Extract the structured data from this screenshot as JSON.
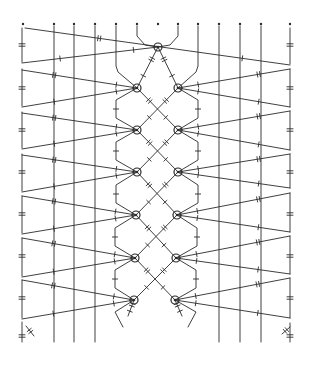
{
  "diagram": {
    "type": "bobbin-lace-pricking",
    "colors": {
      "ink": "#2a2a2a",
      "paper": "#ffffff"
    },
    "pins_top": {
      "y": 24,
      "x": [
        23,
        54,
        74,
        95,
        116,
        137,
        158,
        178,
        198,
        219,
        240,
        261,
        290
      ]
    },
    "straight_threads": {
      "x": [
        54,
        74,
        95,
        219,
        240,
        261
      ],
      "y1": 26,
      "y2": 342
    },
    "edges": {
      "left": {
        "x": 22,
        "y1": 28,
        "y2": 342,
        "gaps": [
          62,
          69,
          106,
          112,
          148,
          154,
          191,
          196,
          233,
          238,
          276,
          280,
          318,
          322
        ]
      },
      "right": {
        "x": 290,
        "y1": 28,
        "y2": 342,
        "gaps": [
          64,
          69,
          107,
          111,
          150,
          154,
          188,
          193,
          232,
          236,
          274,
          278,
          318,
          323
        ]
      },
      "edge_ticks_left_y": [
        45,
        88,
        130,
        172,
        214,
        256,
        298,
        336
      ],
      "edge_ticks_right_y": [
        45,
        88,
        130,
        172,
        214,
        256,
        298,
        336
      ]
    },
    "rings": [
      {
        "cx": 158,
        "cy": 47
      },
      {
        "cx": 137,
        "cy": 88
      },
      {
        "cx": 178,
        "cy": 88
      },
      {
        "cx": 137,
        "cy": 130
      },
      {
        "cx": 178,
        "cy": 130
      },
      {
        "cx": 137,
        "cy": 172
      },
      {
        "cx": 178,
        "cy": 172
      },
      {
        "cx": 136,
        "cy": 215
      },
      {
        "cx": 177,
        "cy": 215
      },
      {
        "cx": 135,
        "cy": 258
      },
      {
        "cx": 176,
        "cy": 258
      },
      {
        "cx": 134,
        "cy": 300
      },
      {
        "cx": 175,
        "cy": 300
      }
    ],
    "rails": [
      {
        "name": "left-rail",
        "points": [
          [
            116,
            26
          ],
          [
            116,
            66
          ],
          [
            118,
            72
          ],
          [
            137,
            88
          ],
          [
            116,
            100
          ],
          [
            116,
            118
          ],
          [
            137,
            130
          ],
          [
            116,
            142
          ],
          [
            116,
            160
          ],
          [
            137,
            172
          ],
          [
            116,
            185
          ],
          [
            116,
            203
          ],
          [
            136,
            215
          ],
          [
            115,
            228
          ],
          [
            115,
            246
          ],
          [
            135,
            258
          ],
          [
            115,
            270
          ],
          [
            115,
            288
          ],
          [
            134,
            300
          ],
          [
            115,
            312
          ],
          [
            123,
            327
          ]
        ]
      },
      {
        "name": "right-rail",
        "points": [
          [
            198,
            26
          ],
          [
            198,
            66
          ],
          [
            196,
            72
          ],
          [
            178,
            88
          ],
          [
            198,
            100
          ],
          [
            198,
            118
          ],
          [
            178,
            130
          ],
          [
            198,
            142
          ],
          [
            198,
            160
          ],
          [
            178,
            172
          ],
          [
            198,
            185
          ],
          [
            198,
            203
          ],
          [
            177,
            215
          ],
          [
            197,
            228
          ],
          [
            197,
            246
          ],
          [
            176,
            258
          ],
          [
            196,
            270
          ],
          [
            196,
            288
          ],
          [
            175,
            300
          ],
          [
            196,
            312
          ],
          [
            188,
            327
          ]
        ]
      },
      {
        "name": "top-left-loop",
        "points": [
          [
            137,
            26
          ],
          [
            137,
            36
          ],
          [
            145,
            45
          ],
          [
            158,
            47
          ]
        ]
      },
      {
        "name": "top-right-loop",
        "points": [
          [
            178,
            26
          ],
          [
            178,
            36
          ],
          [
            170,
            45
          ],
          [
            158,
            47
          ]
        ]
      }
    ],
    "braid_crossings": [
      {
        "from": [
          158,
          47
        ],
        "to": [
          178,
          88
        ]
      },
      {
        "from": [
          158,
          47
        ],
        "to": [
          137,
          88
        ]
      },
      {
        "from": [
          137,
          88
        ],
        "to": [
          178,
          130
        ]
      },
      {
        "from": [
          178,
          88
        ],
        "to": [
          137,
          130
        ]
      },
      {
        "from": [
          137,
          130
        ],
        "to": [
          178,
          172
        ]
      },
      {
        "from": [
          178,
          130
        ],
        "to": [
          137,
          172
        ]
      },
      {
        "from": [
          137,
          172
        ],
        "to": [
          177,
          215
        ]
      },
      {
        "from": [
          178,
          172
        ],
        "to": [
          136,
          215
        ]
      },
      {
        "from": [
          136,
          215
        ],
        "to": [
          176,
          258
        ]
      },
      {
        "from": [
          177,
          215
        ],
        "to": [
          135,
          258
        ]
      },
      {
        "from": [
          135,
          258
        ],
        "to": [
          175,
          300
        ]
      },
      {
        "from": [
          176,
          258
        ],
        "to": [
          134,
          300
        ]
      },
      {
        "from": [
          134,
          300
        ],
        "to": [
          128,
          316
        ]
      },
      {
        "from": [
          175,
          300
        ],
        "to": [
          182,
          316
        ]
      }
    ],
    "passives": [
      {
        "from": [
          25,
          28
        ],
        "to": [
          290,
          65
        ]
      },
      {
        "from": [
          22,
          63
        ],
        "to": [
          158,
          47
        ]
      },
      {
        "from": [
          22,
          70
        ],
        "to": [
          137,
          88
        ]
      },
      {
        "from": [
          22,
          107
        ],
        "to": [
          137,
          88
        ]
      },
      {
        "from": [
          22,
          113
        ],
        "to": [
          137,
          130
        ]
      },
      {
        "from": [
          22,
          149
        ],
        "to": [
          137,
          130
        ]
      },
      {
        "from": [
          22,
          155
        ],
        "to": [
          137,
          172
        ]
      },
      {
        "from": [
          22,
          192
        ],
        "to": [
          137,
          172
        ]
      },
      {
        "from": [
          22,
          196
        ],
        "to": [
          136,
          215
        ]
      },
      {
        "from": [
          22,
          234
        ],
        "to": [
          136,
          215
        ]
      },
      {
        "from": [
          22,
          238
        ],
        "to": [
          135,
          258
        ]
      },
      {
        "from": [
          22,
          277
        ],
        "to": [
          135,
          258
        ]
      },
      {
        "from": [
          22,
          280
        ],
        "to": [
          134,
          300
        ]
      },
      {
        "from": [
          22,
          319
        ],
        "to": [
          134,
          300
        ]
      },
      {
        "from": [
          290,
          69
        ],
        "to": [
          178,
          88
        ]
      },
      {
        "from": [
          290,
          107
        ],
        "to": [
          178,
          88
        ]
      },
      {
        "from": [
          290,
          111
        ],
        "to": [
          178,
          130
        ]
      },
      {
        "from": [
          290,
          150
        ],
        "to": [
          178,
          130
        ]
      },
      {
        "from": [
          290,
          154
        ],
        "to": [
          178,
          172
        ]
      },
      {
        "from": [
          290,
          188
        ],
        "to": [
          178,
          172
        ]
      },
      {
        "from": [
          290,
          193
        ],
        "to": [
          177,
          215
        ]
      },
      {
        "from": [
          290,
          232
        ],
        "to": [
          177,
          215
        ]
      },
      {
        "from": [
          290,
          236
        ],
        "to": [
          176,
          258
        ]
      },
      {
        "from": [
          290,
          274
        ],
        "to": [
          176,
          258
        ]
      },
      {
        "from": [
          290,
          278
        ],
        "to": [
          175,
          300
        ]
      },
      {
        "from": [
          290,
          318
        ],
        "to": [
          175,
          300
        ]
      }
    ],
    "loose_ends": [
      {
        "from": [
          26,
          326
        ],
        "to": [
          34,
          336
        ]
      },
      {
        "from": [
          282,
          334
        ],
        "to": [
          290,
          327
        ]
      }
    ]
  }
}
